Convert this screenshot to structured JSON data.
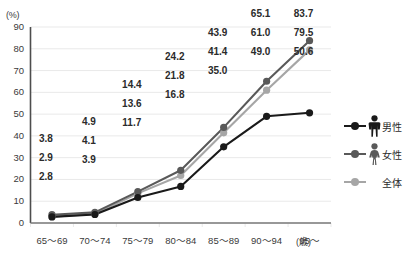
{
  "chart_data": {
    "type": "line",
    "title": "",
    "xlabel": "(歳)",
    "ylabel": "(%)",
    "ylim": [
      0,
      90
    ],
    "ytick_step": 10,
    "grid": true,
    "legend_position": "right",
    "categories": [
      "65〜69",
      "70〜74",
      "75〜79",
      "80〜84",
      "85〜89",
      "90〜94",
      "95〜"
    ],
    "yticks": [
      "90",
      "80",
      "70",
      "60",
      "50",
      "40",
      "30",
      "20",
      "10",
      "0"
    ],
    "series": [
      {
        "name": "女性",
        "color": "#595959",
        "values": [
          3.8,
          4.9,
          14.4,
          24.2,
          43.9,
          65.1,
          83.7
        ],
        "labels": [
          "3.8",
          "4.9",
          "14.4",
          "24.2",
          "43.9",
          "65.1",
          "83.7"
        ]
      },
      {
        "name": "全体",
        "color": "#a6a6a6",
        "values": [
          2.9,
          4.1,
          13.6,
          21.8,
          41.4,
          61.0,
          79.5
        ],
        "labels": [
          "2.9",
          "4.1",
          "13.6",
          "21.8",
          "41.4",
          "61.0",
          "79.5"
        ]
      },
      {
        "name": "男性",
        "color": "#1a1a1a",
        "values": [
          2.8,
          3.9,
          11.7,
          16.8,
          35.0,
          49.0,
          50.6
        ],
        "labels": [
          "2.8",
          "3.9",
          "11.7",
          "16.8",
          "35.0",
          "49.0",
          "50.6"
        ]
      }
    ]
  },
  "axis": {
    "y_unit": "(%)",
    "x_unit": "(歳)"
  },
  "legend": {
    "items": [
      {
        "label": "男性",
        "icon": "male-figure-icon",
        "color": "#1a1a1a"
      },
      {
        "label": "女性",
        "icon": "female-figure-icon",
        "color": "#595959"
      },
      {
        "label": "全体",
        "icon": "none",
        "color": "#a6a6a6"
      }
    ]
  },
  "colors": {
    "grid": "#e9e9e9",
    "axis": "#5a5a5a",
    "text": "#2b2b2b",
    "background": "#ffffff"
  }
}
